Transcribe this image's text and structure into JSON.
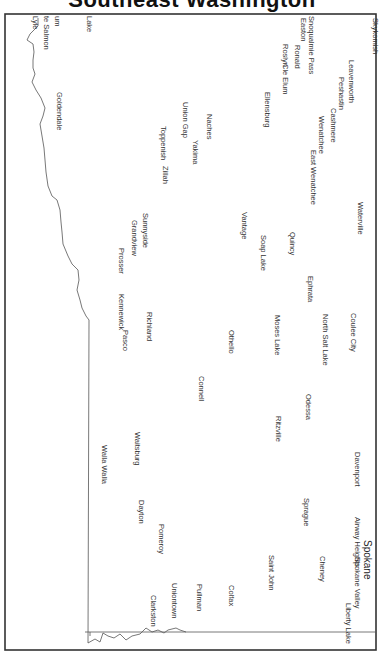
{
  "title": "Southeast Washington",
  "map": {
    "orientation": "rotated 90° clockwise",
    "border_color": "#333333",
    "line_color": "#555555"
  },
  "places": [
    {
      "name": "Skykomish",
      "x": 380,
      "y": 18
    },
    {
      "name": "Snoqualmie Pass",
      "x": 316,
      "y": 16
    },
    {
      "name": "Easton",
      "x": 308,
      "y": 18
    },
    {
      "name": "Ronald",
      "x": 302,
      "y": 45
    },
    {
      "name": "Roslyn",
      "x": 290,
      "y": 44
    },
    {
      "name": "Cle Elum",
      "x": 290,
      "y": 64
    },
    {
      "name": "Leavenworth",
      "x": 356,
      "y": 60
    },
    {
      "name": "Peshastin",
      "x": 346,
      "y": 77
    },
    {
      "name": "Cashmere",
      "x": 338,
      "y": 108
    },
    {
      "name": "Wenatchee",
      "x": 326,
      "y": 116
    },
    {
      "name": "East Wenatchee",
      "x": 318,
      "y": 150
    },
    {
      "name": "Ellensburg",
      "x": 272,
      "y": 92
    },
    {
      "name": "Naches",
      "x": 214,
      "y": 114
    },
    {
      "name": "Yakima",
      "x": 200,
      "y": 140
    },
    {
      "name": "Union Gap",
      "x": 190,
      "y": 102
    },
    {
      "name": "Toppenish",
      "x": 168,
      "y": 126
    },
    {
      "name": "Zillah",
      "x": 170,
      "y": 166
    },
    {
      "name": "Waterville",
      "x": 365,
      "y": 202
    },
    {
      "name": "Vantage",
      "x": 249,
      "y": 212
    },
    {
      "name": "Quincy",
      "x": 297,
      "y": 232
    },
    {
      "name": "Soap Lake",
      "x": 268,
      "y": 235
    },
    {
      "name": "Ephrata",
      "x": 315,
      "y": 276
    },
    {
      "name": "Sunnyside",
      "x": 150,
      "y": 213
    },
    {
      "name": "Grandview",
      "x": 139,
      "y": 220
    },
    {
      "name": "Prosser",
      "x": 126,
      "y": 248
    },
    {
      "name": "Coulee City",
      "x": 358,
      "y": 313
    },
    {
      "name": "North Salt Lake",
      "x": 330,
      "y": 314
    },
    {
      "name": "Moses Lake",
      "x": 282,
      "y": 315
    },
    {
      "name": "Othello",
      "x": 236,
      "y": 330
    },
    {
      "name": "Richland",
      "x": 154,
      "y": 312
    },
    {
      "name": "Kennewick",
      "x": 126,
      "y": 294
    },
    {
      "name": "Pasco",
      "x": 130,
      "y": 330
    },
    {
      "name": "Connell",
      "x": 206,
      "y": 376
    },
    {
      "name": "Odessa",
      "x": 313,
      "y": 394
    },
    {
      "name": "Ritzville",
      "x": 283,
      "y": 416
    },
    {
      "name": "Davenport",
      "x": 362,
      "y": 452
    },
    {
      "name": "Waitsburg",
      "x": 142,
      "y": 432
    },
    {
      "name": "Walla Walla",
      "x": 109,
      "y": 445
    },
    {
      "name": "Sprague",
      "x": 311,
      "y": 498
    },
    {
      "name": "Airway Heights",
      "x": 362,
      "y": 517
    },
    {
      "name": "Dayton",
      "x": 146,
      "y": 500
    },
    {
      "name": "Pomeroy",
      "x": 166,
      "y": 524
    },
    {
      "name": "Cheney",
      "x": 327,
      "y": 556
    },
    {
      "name": "Saint John",
      "x": 276,
      "y": 555
    },
    {
      "name": "Spokane Valley",
      "x": 362,
      "y": 557
    },
    {
      "name": "Liberty Lake",
      "x": 353,
      "y": 603
    },
    {
      "name": "Colfax",
      "x": 236,
      "y": 585
    },
    {
      "name": "Pullman",
      "x": 204,
      "y": 584
    },
    {
      "name": "Uniontown",
      "x": 179,
      "y": 583
    },
    {
      "name": "Clarkston",
      "x": 158,
      "y": 595
    },
    {
      "name": "Goldendale",
      "x": 64,
      "y": 92
    },
    {
      "name": "Lake",
      "x": 94,
      "y": 16
    },
    {
      "name": "um",
      "x": 62,
      "y": 16
    },
    {
      "name": "te Salmon",
      "x": 51,
      "y": 16
    },
    {
      "name": "Lyle",
      "x": 40,
      "y": 16
    }
  ],
  "big_labels": [
    {
      "name": "Spokane",
      "x": 373,
      "y": 540
    }
  ]
}
